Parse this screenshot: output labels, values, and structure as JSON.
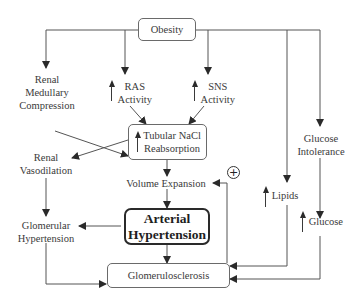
{
  "diagram": {
    "title_node": "Obesity",
    "nodes": {
      "obesity": "Obesity",
      "renal_medullary": [
        "Renal",
        "Medullary",
        "Compression"
      ],
      "ras": [
        "RAS",
        "Activity"
      ],
      "sns": [
        "SNS",
        "Activity"
      ],
      "glucose_intolerance": [
        "Glucose",
        "Intolerance"
      ],
      "tubular": [
        "Tubular NaCl",
        "Reabsorption"
      ],
      "renal_vasodilation": [
        "Renal",
        "Vasodilation"
      ],
      "volume_expansion": "Volume Expansion",
      "positive_feedback": "+",
      "lipids": "Lipids",
      "glucose": "Glucose",
      "glomerular_hypertension": [
        "Glomerular",
        "Hypertension"
      ],
      "arterial_hypertension": [
        "Arterial",
        "Hypertension"
      ],
      "glomerulosclerosis": "Glomerulosclerosis"
    },
    "increase_markers": [
      "RAS Activity",
      "SNS Activity",
      "Tubular NaCl Reabsorption",
      "Lipids",
      "Glucose"
    ],
    "edges": [
      [
        "Obesity",
        "Renal Medullary Compression"
      ],
      [
        "Obesity",
        "RAS Activity"
      ],
      [
        "Obesity",
        "SNS Activity"
      ],
      [
        "Obesity",
        "Glucose Intolerance"
      ],
      [
        "Obesity",
        "Lipids"
      ],
      [
        "Renal Medullary Compression",
        "Tubular NaCl Reabsorption"
      ],
      [
        "RAS Activity",
        "Tubular NaCl Reabsorption"
      ],
      [
        "SNS Activity",
        "Tubular NaCl Reabsorption"
      ],
      [
        "Tubular NaCl Reabsorption",
        "Renal Vasodilation"
      ],
      [
        "Tubular NaCl Reabsorption",
        "Volume Expansion"
      ],
      [
        "Volume Expansion",
        "Arterial Hypertension"
      ],
      [
        "Renal Vasodilation",
        "Glomerular Hypertension"
      ],
      [
        "Arterial Hypertension",
        "Glomerular Hypertension"
      ],
      [
        "Arterial Hypertension",
        "Glomerulosclerosis"
      ],
      [
        "Glomerular Hypertension",
        "Glomerulosclerosis"
      ],
      [
        "Glomerulosclerosis",
        "Volume Expansion"
      ],
      [
        "Lipids",
        "Glomerulosclerosis"
      ],
      [
        "Glucose Intolerance",
        "Glucose"
      ],
      [
        "Glucose",
        "Glomerulosclerosis"
      ]
    ]
  }
}
